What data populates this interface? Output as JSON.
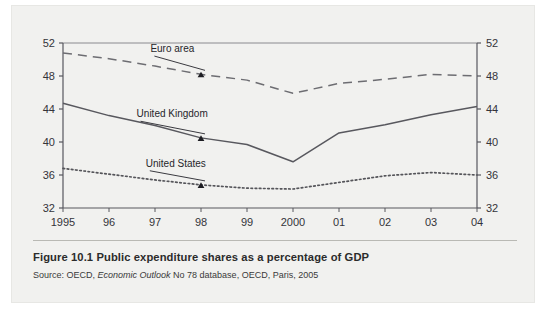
{
  "figure": {
    "number": "Figure 10.1",
    "title": "Public expenditure shares as a percentage of GDP",
    "source": "Source: OECD, ",
    "source_italic": "Economic Outlook",
    "source_rest": " No 78 database, OECD, Paris, 2005"
  },
  "chart_data": {
    "type": "line",
    "title": "Public expenditure shares as a percentage of GDP",
    "xlabel": "",
    "ylabel": "",
    "x": [
      1995,
      1996,
      1997,
      1998,
      1999,
      2000,
      2001,
      2002,
      2003,
      2004
    ],
    "categories": [
      "1995",
      "96",
      "97",
      "98",
      "99",
      "2000",
      "01",
      "02",
      "03",
      "04"
    ],
    "xtick_labels": [
      "1995",
      "96",
      "97",
      "98",
      "99",
      "2000",
      "01",
      "02",
      "03",
      "04"
    ],
    "ytick_labels": [
      "32",
      "36",
      "40",
      "44",
      "48",
      "52"
    ],
    "ytick_values": [
      32,
      36,
      40,
      44,
      48,
      52
    ],
    "ylim": [
      32,
      52
    ],
    "xlim": [
      1995,
      2004
    ],
    "grid": false,
    "legend": "inline-annotations",
    "dual_y_axis": true,
    "series": [
      {
        "name": "Euro area",
        "style": "dashed",
        "color": "#6d6d72",
        "values": [
          50.8,
          50.1,
          49.2,
          48.2,
          47.5,
          45.9,
          47.1,
          47.6,
          48.2,
          48.0
        ],
        "annotation": {
          "label": "Euro area",
          "points_to_x": 1998,
          "points_to_y": 48.2
        }
      },
      {
        "name": "United Kingdom",
        "style": "solid",
        "color": "#58585e",
        "values": [
          44.7,
          43.2,
          42.0,
          40.5,
          39.7,
          37.6,
          41.1,
          42.1,
          43.3,
          44.3
        ],
        "annotation": {
          "label": "United Kingdom",
          "points_to_x": 1998,
          "points_to_y": 40.5
        }
      },
      {
        "name": "United States",
        "style": "dotted",
        "color": "#55555a",
        "values": [
          36.8,
          36.1,
          35.4,
          34.8,
          34.4,
          34.3,
          35.1,
          35.9,
          36.3,
          36.0
        ],
        "annotation": {
          "label": "United States",
          "points_to_x": 1998,
          "points_to_y": 34.8
        }
      }
    ],
    "annotations": [
      {
        "text": "Euro area",
        "x": 1996.9,
        "y": 50.9
      },
      {
        "text": "United Kingdom",
        "x": 1996.6,
        "y": 43.0
      },
      {
        "text": "United States",
        "x": 1996.8,
        "y": 37.0
      }
    ]
  },
  "colors": {
    "panel_background": "#f1f1ef",
    "axis": "#58585e",
    "text": "#2b2b2b"
  }
}
